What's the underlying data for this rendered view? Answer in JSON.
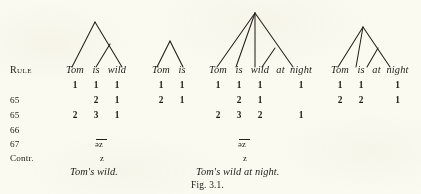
{
  "figure": {
    "caption": "Fig. 3.1.",
    "background_color": "#fbfaf1",
    "ink_color": "#1d1b16"
  },
  "row_labels": {
    "header": "Rule",
    "blank": "",
    "r1": "65",
    "r2": "65",
    "r3": "66",
    "r4": "67",
    "r5": "Contr."
  },
  "columns": [
    {
      "id": "col-tom-is-wild",
      "phrase": [
        "Tom",
        "is",
        "wild"
      ],
      "phrase_text": "Tom is wild",
      "rows": [
        {
          "label": "",
          "values": [
            "1",
            "1",
            "1"
          ]
        },
        {
          "label": "65",
          "values": [
            "",
            "2",
            "1"
          ]
        },
        {
          "label": "65",
          "values": [
            "2",
            "3",
            "1"
          ]
        },
        {
          "label": "66",
          "values": [
            "",
            "—",
            ""
          ]
        },
        {
          "label": "67",
          "values": [
            "",
            "əz",
            ""
          ]
        },
        {
          "label": "Contr.",
          "values": [
            "",
            "z",
            ""
          ]
        }
      ],
      "rule66_mark": "—",
      "rule67_phon": "əz",
      "contr_phon": "z",
      "result": "Tom's wild."
    },
    {
      "id": "col-tom-is",
      "phrase": [
        "Tom",
        "is"
      ],
      "phrase_text": "Tom is",
      "rows": [
        {
          "label": "",
          "values": [
            "1",
            "1"
          ]
        },
        {
          "label": "65",
          "values": [
            "2",
            "1"
          ]
        }
      ],
      "rule66_mark": "",
      "rule67_phon": "",
      "contr_phon": "",
      "result": ""
    },
    {
      "id": "col-tom-is-wild-at-night",
      "phrase": [
        "Tom",
        "is",
        "wild",
        "at",
        "night"
      ],
      "phrase_text": "Tom is wild at night",
      "rows": [
        {
          "label": "",
          "values": [
            "1",
            "1",
            "1",
            "",
            "1"
          ]
        },
        {
          "label": "65",
          "values": [
            "",
            "2",
            "1",
            "",
            ""
          ]
        },
        {
          "label": "65",
          "values": [
            "2",
            "3",
            "2",
            "",
            "1"
          ]
        },
        {
          "label": "66",
          "values": [
            "",
            "—",
            "",
            "",
            ""
          ]
        },
        {
          "label": "67",
          "values": [
            "",
            "əz",
            "",
            "",
            ""
          ]
        },
        {
          "label": "Contr.",
          "values": [
            "",
            "z",
            "",
            "",
            ""
          ]
        }
      ],
      "rule66_mark": "—",
      "rule67_phon": "əz",
      "contr_phon": "z",
      "result": "Tom's wild at night."
    },
    {
      "id": "col-tom-is-at-night",
      "phrase": [
        "Tom",
        "is",
        "at",
        "night"
      ],
      "phrase_text": "Tom is at night",
      "rows": [
        {
          "label": "",
          "values": [
            "1",
            "1",
            "",
            "1"
          ]
        },
        {
          "label": "65",
          "values": [
            "2",
            "2",
            "",
            "1"
          ]
        }
      ],
      "rule66_mark": "",
      "rule67_phon": "",
      "contr_phon": "",
      "result": ""
    }
  ]
}
